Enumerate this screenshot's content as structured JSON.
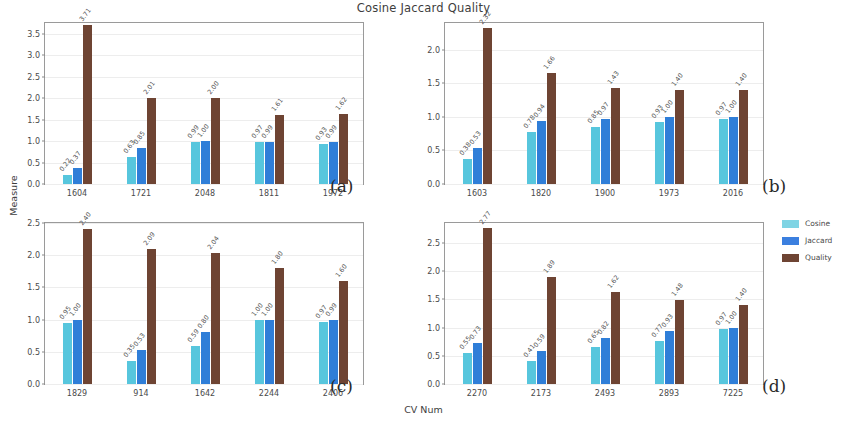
{
  "chart_data": {
    "type": "bar",
    "title": "Cosine Jaccard Quality",
    "xlabel": "CV Num",
    "ylabel": "Measure",
    "grid": true,
    "legend_position": "right",
    "series_names": [
      "Cosine",
      "Jaccard",
      "Quality"
    ],
    "series_colors": [
      "#57c6dd",
      "#2f7ed8",
      "#6e4433"
    ],
    "panels": [
      {
        "tag": "(a)",
        "categories": [
          "1604",
          "1721",
          "2048",
          "1811",
          "1972"
        ],
        "ylim": [
          0.0,
          3.75
        ],
        "yticks": [
          "0.0",
          "0.5",
          "1.0",
          "1.5",
          "2.0",
          "2.5",
          "3.0",
          "3.5"
        ],
        "ytickvals": [
          0.0,
          0.5,
          1.0,
          1.5,
          2.0,
          2.5,
          3.0,
          3.5
        ],
        "series": [
          {
            "name": "Cosine",
            "values": [
              0.22,
              0.63,
              0.99,
              0.97,
              0.93
            ],
            "labels": [
              "0.22",
              "0.63",
              "0.99",
              "0.97",
              "0.93"
            ]
          },
          {
            "name": "Jaccard",
            "values": [
              0.37,
              0.85,
              1.0,
              0.99,
              0.99
            ],
            "labels": [
              "0.37",
              "0.85",
              "1.00",
              "0.99",
              "0.99"
            ]
          },
          {
            "name": "Quality",
            "values": [
              3.71,
              2.01,
              2.0,
              1.61,
              1.62
            ],
            "labels": [
              "3.71",
              "2.01",
              "2.00",
              "1.61",
              "1.62"
            ]
          }
        ]
      },
      {
        "tag": "(b)",
        "categories": [
          "1603",
          "1820",
          "1900",
          "1973",
          "2016"
        ],
        "ylim": [
          0.0,
          2.4
        ],
        "yticks": [
          "0.0",
          "0.5",
          "1.0",
          "1.5",
          "2.0"
        ],
        "ytickvals": [
          0.0,
          0.5,
          1.0,
          1.5,
          2.0
        ],
        "series": [
          {
            "name": "Cosine",
            "values": [
              0.38,
              0.78,
              0.85,
              0.93,
              0.97
            ],
            "labels": [
              "0.38",
              "0.78",
              "0.85",
              "0.93",
              "0.97"
            ]
          },
          {
            "name": "Jaccard",
            "values": [
              0.53,
              0.94,
              0.97,
              1.0,
              1.0
            ],
            "labels": [
              "0.53",
              "0.94",
              "0.97",
              "1.00",
              "1.00"
            ]
          },
          {
            "name": "Quality",
            "values": [
              2.32,
              1.66,
              1.43,
              1.4,
              1.4
            ],
            "labels": [
              "2.32",
              "1.66",
              "1.43",
              "1.40",
              "1.40"
            ]
          }
        ]
      },
      {
        "tag": "(c)",
        "categories": [
          "1829",
          "914",
          "1642",
          "2244",
          "2406"
        ],
        "ylim": [
          0.0,
          2.5
        ],
        "yticks": [
          "0.0",
          "0.5",
          "1.0",
          "1.5",
          "2.0",
          "2.5"
        ],
        "ytickvals": [
          0.0,
          0.5,
          1.0,
          1.5,
          2.0,
          2.5
        ],
        "series": [
          {
            "name": "Cosine",
            "values": [
              0.95,
              0.35,
              0.59,
              1.0,
              0.97
            ],
            "labels": [
              "0.95",
              "0.35",
              "0.59",
              "1.00",
              "0.97"
            ]
          },
          {
            "name": "Jaccard",
            "values": [
              1.0,
              0.53,
              0.8,
              1.0,
              0.99
            ],
            "labels": [
              "1.00",
              "0.53",
              "0.80",
              "1.00",
              "0.99"
            ]
          },
          {
            "name": "Quality",
            "values": [
              2.4,
              2.09,
              2.04,
              1.8,
              1.6
            ],
            "labels": [
              "2.40",
              "2.09",
              "2.04",
              "1.80",
              "1.60"
            ]
          }
        ]
      },
      {
        "tag": "(d)",
        "categories": [
          "2270",
          "2173",
          "2493",
          "2893",
          "7225"
        ],
        "ylim": [
          0.0,
          2.85
        ],
        "yticks": [
          "0.0",
          "0.5",
          "1.0",
          "1.5",
          "2.0",
          "2.5"
        ],
        "ytickvals": [
          0.0,
          0.5,
          1.0,
          1.5,
          2.0,
          2.5
        ],
        "series": [
          {
            "name": "Cosine",
            "values": [
              0.55,
              0.41,
              0.65,
              0.77,
              0.97
            ],
            "labels": [
              "0.55",
              "0.41",
              "0.65",
              "0.77",
              "0.97"
            ]
          },
          {
            "name": "Jaccard",
            "values": [
              0.73,
              0.59,
              0.82,
              0.93,
              1.0
            ],
            "labels": [
              "0.73",
              "0.59",
              "0.82",
              "0.93",
              "1.00"
            ]
          },
          {
            "name": "Quality",
            "values": [
              2.77,
              1.89,
              1.62,
              1.48,
              1.4
            ],
            "labels": [
              "2.77",
              "1.89",
              "1.62",
              "1.48",
              "1.40"
            ]
          }
        ]
      }
    ],
    "legend": [
      {
        "label": "Cosine",
        "color": "#7fd4e4"
      },
      {
        "label": "Jaccard",
        "color": "#3b7fdf"
      },
      {
        "label": "Quality",
        "color": "#6e4433"
      }
    ]
  }
}
